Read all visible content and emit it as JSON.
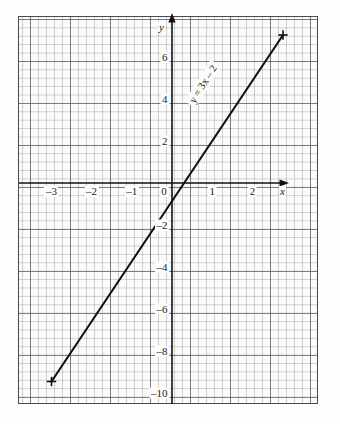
{
  "figure": {
    "kind": "graph-paper-line-plot",
    "background_color": "#fdfdfd",
    "grid_minor_color": "#8c8c94",
    "grid_major_color": "#5a5a60",
    "ink_color": "#111111"
  },
  "axes": {
    "x_axis_name": "x",
    "y_axis_name": "y",
    "x_ticks": [
      "–3",
      "–2",
      "–1",
      "0",
      "1",
      "2"
    ],
    "x_tick_values": [
      -3,
      -2,
      -1,
      0,
      1,
      2
    ],
    "y_ticks": [
      "6",
      "4",
      "2",
      "–2",
      "–4",
      "–6",
      "–8",
      "–10",
      "–12"
    ],
    "y_tick_values": [
      6,
      4,
      2,
      -2,
      -4,
      -6,
      -8,
      -10,
      -12
    ],
    "x_range": [
      -3.45,
      2.88
    ],
    "y_range": [
      -12.4,
      7.2
    ],
    "origin_label": "0",
    "arrows": [
      "x-axis-right",
      "y-axis-up"
    ]
  },
  "annotation": {
    "equation_prefix": "y",
    "equation_text": "y = 3x – 2",
    "equation_lhs": "y",
    "equation_rhs": "3x – 2",
    "equals": " = ",
    "x_symbol": "x",
    "rotation_degrees": -58
  },
  "chart_data": {
    "type": "line",
    "title": "",
    "xlabel": "x",
    "ylabel": "y",
    "xlim": [
      -3.45,
      2.88
    ],
    "ylim": [
      -12.4,
      7.2
    ],
    "grid": true,
    "legend": "none",
    "annotations": [
      {
        "text": "y = 3x – 2",
        "x": 1.0,
        "y": 1.0,
        "rotation": -58
      }
    ],
    "xticks": [
      -3,
      -2,
      -1,
      0,
      1,
      2
    ],
    "xticklabels": [
      "–3",
      "–2",
      "–1",
      "0",
      "1",
      "2"
    ],
    "yticks": [
      6,
      4,
      2,
      0,
      -2,
      -4,
      -6,
      -8,
      -10,
      -12
    ],
    "yticklabels": [
      "6",
      "4",
      "2",
      "0",
      "–2",
      "–4",
      "–6",
      "–8",
      "–10",
      "–12"
    ],
    "series": [
      {
        "name": "y = 3x – 2",
        "equation": "y = 3x - 2",
        "slope": 3,
        "intercept": -2,
        "marker": "cross",
        "endpoints": [
          {
            "x": -3,
            "y": -11
          },
          {
            "x": 2.78,
            "y": 6.35
          }
        ],
        "points": [
          {
            "x": -3,
            "y": -11
          },
          {
            "x": -2,
            "y": -8
          },
          {
            "x": -1,
            "y": -5
          },
          {
            "x": 0,
            "y": -2
          },
          {
            "x": 1,
            "y": 1
          },
          {
            "x": 2,
            "y": 4
          },
          {
            "x": 2.78,
            "y": 6.35
          }
        ],
        "x": [
          -3,
          -2,
          -1,
          0,
          1,
          2,
          2.78
        ],
        "values": [
          -11,
          -8,
          -5,
          -2,
          1,
          4,
          6.35
        ]
      }
    ]
  }
}
